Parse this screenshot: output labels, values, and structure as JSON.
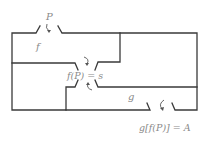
{
  "diagram": {
    "labels": {
      "entry": "P",
      "room_f": "f",
      "middle_door": "f(P) = s",
      "room_g": "g",
      "exit": "g[f(P)] = A"
    },
    "colors": {
      "wall": "#3a3a3a",
      "text": "#8a8a8a",
      "arrow": "#555555"
    }
  }
}
